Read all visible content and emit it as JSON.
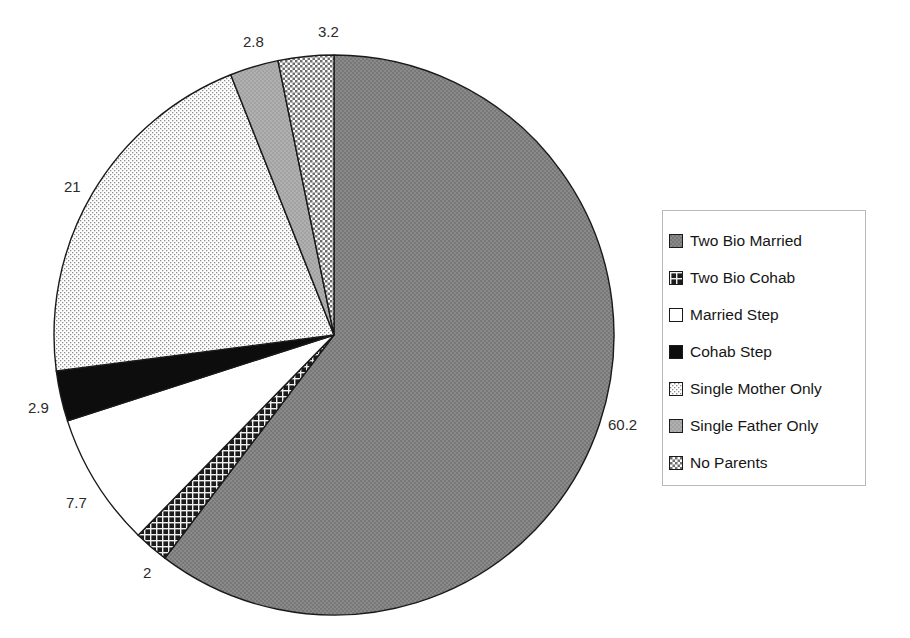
{
  "chart_data": {
    "type": "pie",
    "title": "",
    "subtitle": "",
    "xlabel": "",
    "ylabel": "",
    "legend_position": "right",
    "grid": false,
    "start_angle_deg": 0,
    "direction": "clockwise",
    "categories": [
      "Two Bio Married",
      "Two Bio Cohab",
      "Married Step",
      "Cohab Step",
      "Single Mother Only",
      "Single Father Only",
      "No Parents"
    ],
    "values": [
      60.2,
      2,
      7.7,
      2.9,
      21,
      2.8,
      3.2
    ],
    "labels": [
      "60.2",
      "2",
      "7.7",
      "2.9",
      "21",
      "2.8",
      "3.2"
    ],
    "slices": [
      {
        "name": "Two Bio Married",
        "value": 60.2,
        "label": "60.2",
        "pattern": "solid-gray",
        "fill": "#808080",
        "label_x": 608,
        "label_y": 416
      },
      {
        "name": "Two Bio Cohab",
        "value": 2,
        "label": "2",
        "pattern": "dark-crosshatch",
        "fill": "#262626",
        "label_x": 143,
        "label_y": 564
      },
      {
        "name": "Married Step",
        "value": 7.7,
        "label": "7.7",
        "pattern": "white",
        "fill": "#ffffff",
        "label_x": 66,
        "label_y": 494
      },
      {
        "name": "Cohab Step",
        "value": 2.9,
        "label": "2.9",
        "pattern": "black",
        "fill": "#101010",
        "label_x": 28,
        "label_y": 399
      },
      {
        "name": "Single Mother Only",
        "value": 21,
        "label": "21",
        "pattern": "light-dots",
        "fill": "#f2f2f2",
        "label_x": 64,
        "label_y": 178
      },
      {
        "name": "Single Father Only",
        "value": 2.8,
        "label": "2.8",
        "pattern": "mid-gray",
        "fill": "#a8a8a8",
        "label_x": 243,
        "label_y": 33
      },
      {
        "name": "No Parents",
        "value": 3.2,
        "label": "3.2",
        "pattern": "checker",
        "fill": "#c9c9c9",
        "label_x": 318,
        "label_y": 23
      }
    ],
    "geometry": {
      "center_x": 334,
      "center_y": 335,
      "radius": 280
    }
  },
  "legend": {
    "items": [
      {
        "label": "Two Bio Married",
        "swatch": "solid-gray"
      },
      {
        "label": "Two Bio Cohab",
        "swatch": "dark-crosshatch"
      },
      {
        "label": "Married Step",
        "swatch": "white"
      },
      {
        "label": "Cohab Step",
        "swatch": "black"
      },
      {
        "label": "Single Mother Only",
        "swatch": "light-dots"
      },
      {
        "label": "Single Father Only",
        "swatch": "mid-gray"
      },
      {
        "label": "No Parents",
        "swatch": "checker"
      }
    ]
  },
  "colors": {
    "solid_gray": "#808080",
    "dark_crosshatch": "#262626",
    "white": "#ffffff",
    "black": "#101010",
    "light_dots": "#f2f2f2",
    "mid_gray": "#a8a8a8",
    "checker": "#c9c9c9",
    "outline": "#1a1a1a",
    "text": "#161616"
  }
}
